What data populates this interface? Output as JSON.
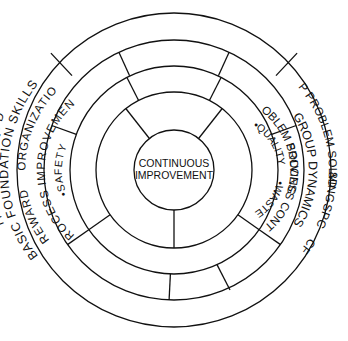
{
  "diagram": {
    "type": "concentric-ring-diagram",
    "stroke_color": "#111111",
    "background_color": "#ffffff",
    "center": {
      "line1": "CONTINUOUS",
      "line2": "IMPROVEMENT"
    },
    "core_bullets": [
      {
        "label": "•SAFETY"
      },
      {
        "label": "•WASTE"
      },
      {
        "label": "•QUALITY"
      }
    ],
    "rings": [
      {
        "index": 1,
        "name": "outer-blank-ring",
        "segments": []
      },
      {
        "index": 2,
        "name": "basic-foundation-skills-ring",
        "segments": [
          {
            "label": "BASIC FOUNDATION SKILLS"
          },
          {
            "label": "QFD"
          },
          {
            "label": "DE"
          },
          {
            "label": "TPM"
          },
          {
            "label": "CFM"
          },
          {
            "label": "SPC"
          },
          {
            "label": "8D"
          },
          {
            "label": "6-STEP PROBLEM SOLVING"
          }
        ]
      },
      {
        "index": 3,
        "name": "organization-ring",
        "segments": [
          {
            "label": "ORGANIZATION"
          },
          {
            "label": "REWARD"
          },
          {
            "label": "GROUP DYNAMICS"
          }
        ]
      },
      {
        "index": 4,
        "name": "process-ring",
        "segments": [
          {
            "label": "PROCESS IMPROVEMENT"
          },
          {
            "label": "PROCESS CONTROL"
          },
          {
            "label": "PROBLEM SOLVING"
          }
        ]
      }
    ]
  }
}
